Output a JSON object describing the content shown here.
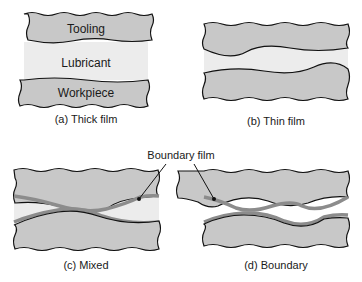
{
  "figure": {
    "panels": [
      {
        "id": "a",
        "caption": "(a) Thick film",
        "layers": [
          "Tooling",
          "Lubricant",
          "Workpiece"
        ]
      },
      {
        "id": "b",
        "caption": "(b) Thin film"
      },
      {
        "id": "c",
        "caption": "(c) Mixed"
      },
      {
        "id": "d",
        "caption": "(d) Boundary"
      }
    ],
    "callout": "Boundary film",
    "colors": {
      "solid": "#c8c8c8",
      "lubricant": "#ececec",
      "boundary_film": "#8c8c8c",
      "outline": "#111111"
    }
  }
}
